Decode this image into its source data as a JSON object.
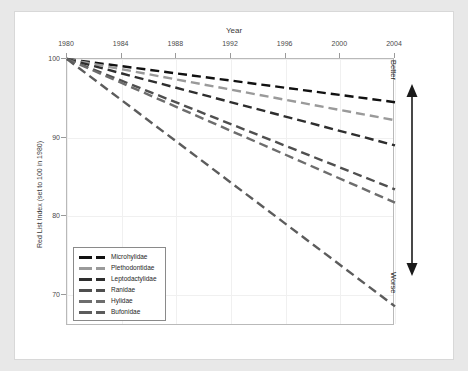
{
  "figure": {
    "background_color": "#e8e8e8",
    "panel_color": "#ffffff"
  },
  "axes": {
    "x_title": "Year",
    "y_title": "Red List Index (set to 100 in 1980)",
    "x_ticks": [
      "1980",
      "1984",
      "1988",
      "1992",
      "1996",
      "2000",
      "2004"
    ],
    "y_ticks": [
      "100",
      "90",
      "80",
      "70"
    ]
  },
  "annotations": {
    "better": "Better",
    "worse": "Worse"
  },
  "legend": {
    "items": [
      {
        "label": "Microhylidae",
        "color": "#111111"
      },
      {
        "label": "Plethodontidae",
        "color": "#9a9a9a"
      },
      {
        "label": "Leptodactylidae",
        "color": "#2e2e2e"
      },
      {
        "label": "Ranidae",
        "color": "#4f4f4f"
      },
      {
        "label": "Hylidae",
        "color": "#6d6d6d"
      },
      {
        "label": "Bufonidae",
        "color": "#5c5c5c"
      }
    ]
  },
  "chart_data": {
    "type": "line",
    "title": "",
    "xlabel": "Year",
    "ylabel": "Red List Index (set to 100 in 1980)",
    "xlim": [
      1980,
      2004
    ],
    "ylim": [
      66,
      100
    ],
    "xticks": [
      1980,
      1984,
      1988,
      1992,
      1996,
      2000,
      2004
    ],
    "yticks": [
      100,
      90,
      80,
      70
    ],
    "grid": true,
    "legend_position": "lower-left",
    "line_style": "dashed",
    "x": [
      1980,
      2004
    ],
    "series": [
      {
        "name": "Microhylidae",
        "color": "#111111",
        "values": [
          100,
          94.5
        ]
      },
      {
        "name": "Plethodontidae",
        "color": "#9a9a9a",
        "values": [
          100,
          92.2
        ]
      },
      {
        "name": "Leptodactylidae",
        "color": "#2e2e2e",
        "values": [
          100,
          89.0
        ]
      },
      {
        "name": "Ranidae",
        "color": "#4f4f4f",
        "values": [
          100,
          83.4
        ]
      },
      {
        "name": "Hylidae",
        "color": "#6d6d6d",
        "values": [
          100,
          81.7
        ]
      },
      {
        "name": "Bufonidae",
        "color": "#5c5c5c",
        "values": [
          100,
          68.5
        ]
      }
    ],
    "annotations": [
      {
        "text": "Better",
        "position": "right-top"
      },
      {
        "text": "Worse",
        "position": "right-bottom"
      }
    ]
  }
}
